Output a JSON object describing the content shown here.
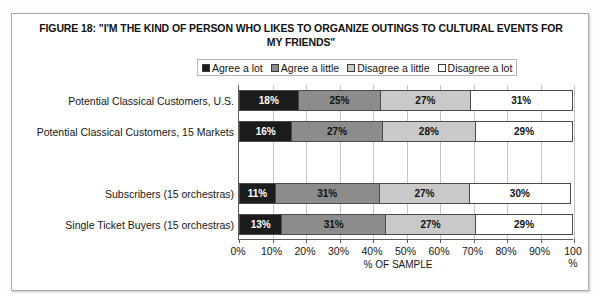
{
  "figure": {
    "title": "FIGURE 18: \"I'M THE KIND OF PERSON WHO LIKES TO ORGANIZE OUTINGS TO CULTURAL EVENTS FOR MY FRIENDS\"",
    "axis_title": "% OF SAMPLE"
  },
  "legend": {
    "entries": [
      {
        "label": "Agree a lot",
        "color": "#1c1c1c"
      },
      {
        "label": "Agree a little",
        "color": "#8c8c8c"
      },
      {
        "label": "Disagree a little",
        "color": "#c9c9c9"
      },
      {
        "label": "Disagree a lot",
        "color": "#ffffff"
      }
    ]
  },
  "axis": {
    "tick_labels": [
      "0%",
      "10%",
      "20%",
      "30%",
      "40%",
      "50%",
      "60%",
      "70%",
      "80%",
      "90%",
      "100\n%"
    ],
    "tick_values": [
      0,
      10,
      20,
      30,
      40,
      50,
      60,
      70,
      80,
      90,
      100
    ]
  },
  "chart_data": {
    "type": "bar",
    "orientation": "horizontal",
    "stacked": true,
    "stack_total": 100,
    "title": "FIGURE 18: \"I'M THE KIND OF PERSON WHO LIKES TO ORGANIZE OUTINGS TO CULTURAL EVENTS FOR MY FRIENDS\"",
    "xlabel": "% OF SAMPLE",
    "ylabel": "",
    "xlim": [
      0,
      100
    ],
    "grid": true,
    "legend_position": "top",
    "categories": [
      "Potential Classical Customers, U.S.",
      "Potential Classical Customers, 15 Markets",
      "",
      "Subscribers (15 orchestras)",
      "Single Ticket Buyers (15 orchestras)"
    ],
    "series": [
      {
        "name": "Agree a lot",
        "color": "#1c1c1c",
        "values": [
          18,
          16,
          null,
          11,
          13
        ]
      },
      {
        "name": "Agree a little",
        "color": "#8c8c8c",
        "values": [
          25,
          27,
          null,
          31,
          31
        ]
      },
      {
        "name": "Disagree a little",
        "color": "#c9c9c9",
        "values": [
          27,
          28,
          null,
          27,
          27
        ]
      },
      {
        "name": "Disagree a lot",
        "color": "#ffffff",
        "values": [
          31,
          29,
          null,
          30,
          29
        ]
      }
    ],
    "data_labels": [
      [
        "18%",
        "25%",
        "27%",
        "31%"
      ],
      [
        "16%",
        "27%",
        "28%",
        "29%"
      ],
      null,
      [
        "11%",
        "31%",
        "27%",
        "30%"
      ],
      [
        "13%",
        "31%",
        "27%",
        "29%"
      ]
    ]
  }
}
